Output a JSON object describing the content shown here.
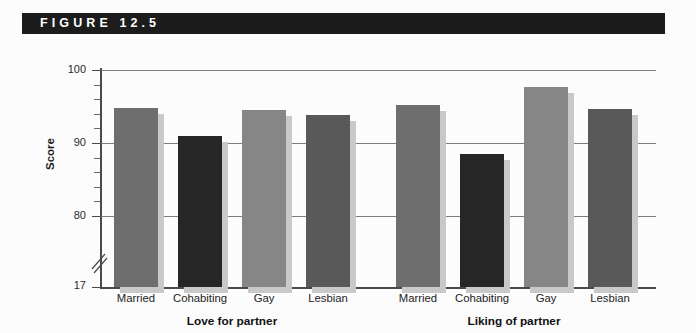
{
  "figure": {
    "banner_label": "F I G U R E   1 2 . 5",
    "banner_text_raw": "FIGURE 12.5",
    "banner_color": "#1c1c1c",
    "banner_text_color": "#ffffff",
    "background_color": "#fcfcfc"
  },
  "chart_data": {
    "type": "bar",
    "title": "",
    "subtitle": "",
    "xlabel": "",
    "ylabel": "Score",
    "ylim": [
      80,
      100
    ],
    "y_axis_break_value": "17",
    "y_ticks_major": [
      "80",
      "90",
      "100"
    ],
    "y_tick_minor_step": 2,
    "grid": true,
    "grid_axis": "y",
    "legend": "none",
    "legend_position": "none",
    "group_labels": [
      "Love for partner",
      "Liking of partner"
    ],
    "categories": [
      "Married",
      "Cohabiting",
      "Gay",
      "Lesbian"
    ],
    "series": [
      {
        "name": "Love for partner",
        "values": [
          94.8,
          91.0,
          94.5,
          93.9
        ]
      },
      {
        "name": "Liking of partner",
        "values": [
          95.2,
          88.5,
          97.7,
          94.6
        ]
      }
    ],
    "bar_colors": [
      "#6e6e6e",
      "#262626",
      "#868686",
      "#595959"
    ],
    "bar_shadow_color": "#c9c9c9",
    "gridline_color": "#7d7d7d",
    "axis_color": "#4a4a4a"
  }
}
